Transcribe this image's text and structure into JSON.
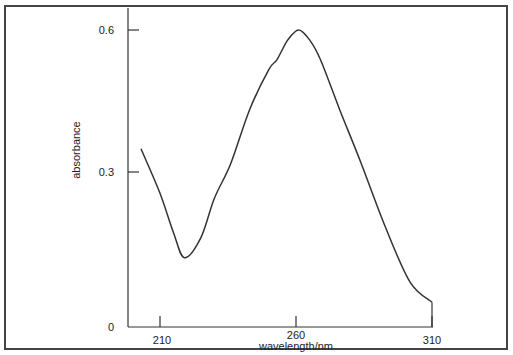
{
  "chart_data": {
    "type": "line",
    "title": "",
    "xlabel": "wavelength/nm",
    "ylabel": "absorbance",
    "xlim": [
      203,
      310
    ],
    "ylim": [
      0,
      0.65
    ],
    "x_ticks": [
      210,
      260,
      310
    ],
    "y_ticks": [
      0,
      0.3,
      0.6
    ],
    "x_tick_labels": [
      "210",
      "260",
      "310"
    ],
    "y_tick_labels": [
      "0",
      "0.3",
      "0.6"
    ],
    "grid": false,
    "legend": null,
    "series": [
      {
        "name": "absorbance spectrum",
        "x": [
          203,
          210,
          215,
          219,
          225,
          230,
          236,
          243,
          250,
          253,
          257,
          261,
          265,
          269,
          276,
          284,
          293,
          302,
          310
        ],
        "y": [
          0.36,
          0.27,
          0.19,
          0.14,
          0.18,
          0.26,
          0.33,
          0.44,
          0.52,
          0.54,
          0.58,
          0.6,
          0.58,
          0.54,
          0.44,
          0.33,
          0.2,
          0.09,
          0.05
        ]
      }
    ],
    "annotations": [
      "curve ends with vertical drop to x-axis at 310"
    ]
  },
  "labels": {
    "xlabel": "wavelength/nm",
    "ylabel": "absorbance",
    "xticks": [
      "210",
      "260",
      "310"
    ],
    "yticks": [
      "0",
      "0.3",
      "0.6"
    ]
  }
}
